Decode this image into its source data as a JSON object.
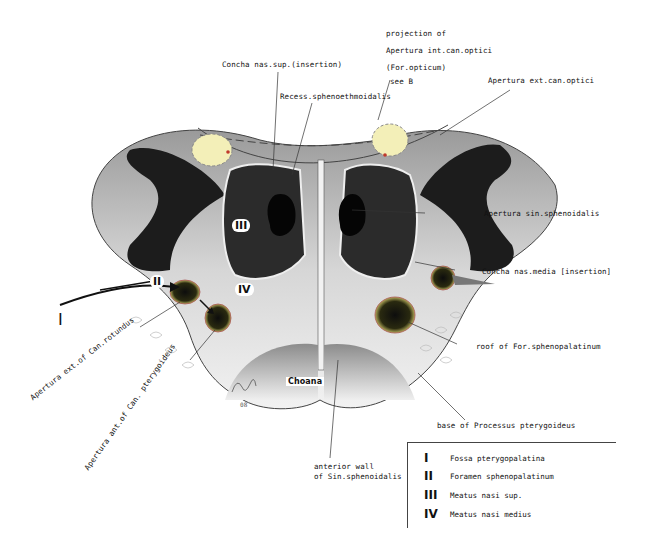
{
  "labels": {
    "projection_line1": "projection of",
    "projection_line2": "Apertura int.can.optici",
    "projection_line3": "(For.opticum)",
    "projection_line4": "see B",
    "concha_sup": "Concha nas.sup.(insertion)",
    "recess": "Recess.sphenoethmoidalis",
    "apertura_ext_optici": "Apertura ext.can.optici",
    "apertura_sin": "Apertura  sin.sphenoidalis",
    "concha_media": "Concha nas.media [insertion]",
    "roof_for": "roof of For.sphenopalatinum",
    "base_processus": "base of Processus pterygoideus",
    "choana": "Choana",
    "anterior_wall_line1": "anterior wall",
    "anterior_wall_line2": "of Sin.sphenoidalis",
    "apertura_rotundus": "Apertura ext.of Can.rotundus",
    "apertura_pterygoideus": "Apertura ant.of Can. pterygoideus",
    "signature": "08"
  },
  "markers": {
    "I": "I",
    "II": "II",
    "III": "III",
    "IV": "IV"
  },
  "legend": {
    "items": [
      {
        "numeral": "I",
        "text": "Fossa pterygopalatina"
      },
      {
        "numeral": "II",
        "text": "Foramen sphenopalatinum"
      },
      {
        "numeral": "III",
        "text": "Meatus nasi sup."
      },
      {
        "numeral": "IV",
        "text": "Meatus nasi medius"
      }
    ]
  },
  "colors": {
    "bone_dark": "#1c1c1c",
    "bone_mid": "#6e6e6e",
    "bone_light": "#d9d9d9",
    "optic_projection": "#f3efb8",
    "accent_red": "#c0392b",
    "leader_line": "#333333"
  }
}
